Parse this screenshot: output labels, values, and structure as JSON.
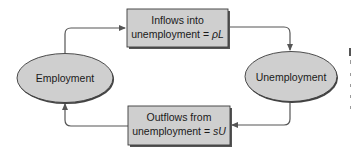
{
  "diagram": {
    "type": "flow-cycle",
    "nodes": {
      "employment": {
        "label": "Employment",
        "shape": "ellipse"
      },
      "unemployment": {
        "label": "Unemployment",
        "shape": "ellipse"
      },
      "inflows": {
        "line1": "Inflows into",
        "line2_prefix": "unemployment = ",
        "line2_var": "ρL",
        "shape": "box"
      },
      "outflows": {
        "line1": "Outflows from",
        "line2_prefix": "unemployment = ",
        "line2_var": "sU",
        "shape": "box"
      }
    },
    "edges": [
      {
        "from": "Employment",
        "to": "Inflows into unemployment = ρL"
      },
      {
        "from": "Inflows into unemployment = ρL",
        "to": "Unemployment"
      },
      {
        "from": "Unemployment",
        "to": "Outflows from unemployment = sU"
      },
      {
        "from": "Outflows from unemployment = sU",
        "to": "Employment"
      }
    ],
    "colors": {
      "node_fill": "#cfcfcf",
      "node_stroke": "#3a3a3a",
      "shadow": "#555555",
      "edge": "#555555",
      "background": "#ffffff"
    }
  }
}
